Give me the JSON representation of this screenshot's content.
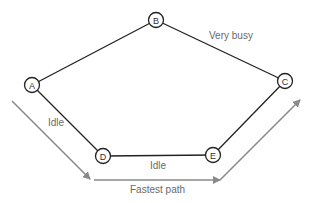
{
  "diagram": {
    "nodes": [
      {
        "id": "A",
        "label": "A",
        "x": 32,
        "y": 85
      },
      {
        "id": "B",
        "label": "B",
        "x": 156,
        "y": 20
      },
      {
        "id": "C",
        "label": "C",
        "x": 285,
        "y": 81
      },
      {
        "id": "D",
        "label": "D",
        "x": 103,
        "y": 156
      },
      {
        "id": "E",
        "label": "E",
        "x": 213,
        "y": 155
      }
    ],
    "edges": [
      {
        "from": "A",
        "to": "B"
      },
      {
        "from": "B",
        "to": "C"
      },
      {
        "from": "A",
        "to": "D"
      },
      {
        "from": "D",
        "to": "E"
      },
      {
        "from": "E",
        "to": "C"
      }
    ],
    "edge_labels": {
      "b_c": "Very busy",
      "a_d": "Idle",
      "d_e": "Idle"
    },
    "path_label": "Fastest path",
    "colors": {
      "edge": "#222222",
      "path": "#8a8a8a",
      "label": "#6a6a6a"
    }
  }
}
